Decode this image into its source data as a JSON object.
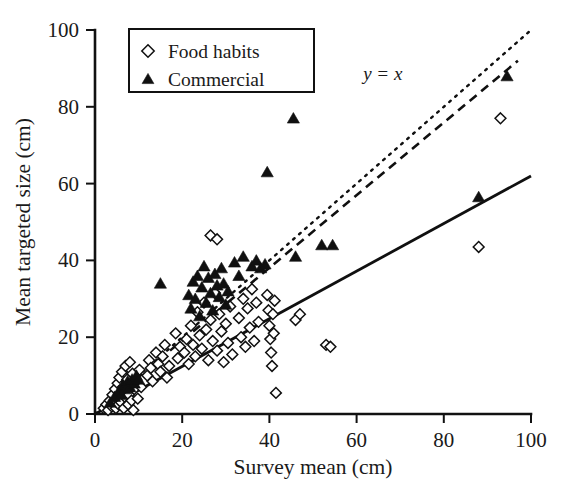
{
  "chart_data": {
    "type": "scatter",
    "title": "",
    "xlabel": "Survey mean (cm)",
    "ylabel": "Mean targeted size (cm)",
    "xlim": [
      0,
      100
    ],
    "ylim": [
      0,
      100
    ],
    "xticks": [
      0,
      20,
      40,
      60,
      80,
      100
    ],
    "yticks": [
      0,
      20,
      40,
      60,
      80,
      100
    ],
    "xtick_labels": [
      "0",
      "20",
      "40",
      "60",
      "80",
      "100"
    ],
    "ytick_labels": [
      "0",
      "20",
      "40",
      "60",
      "80",
      "100"
    ],
    "grid": false,
    "legend_position": "top-left",
    "annotations": [
      {
        "text": "y = x",
        "x": 66,
        "y": 87,
        "style": "italic"
      }
    ],
    "reference_lines": [
      {
        "name": "identity-line",
        "label": "y = x",
        "style": "dotted",
        "x0": 0,
        "y0": 0,
        "x1": 100,
        "y1": 100
      },
      {
        "name": "commercial-fit-line",
        "label": "",
        "style": "dashed",
        "x0": 4,
        "y0": 4,
        "x1": 97,
        "y1": 92
      },
      {
        "name": "food-habits-fit-line",
        "label": "",
        "style": "solid",
        "x0": 0,
        "y0": 0,
        "x1": 100,
        "y1": 62
      }
    ],
    "series": [
      {
        "name": "Food habits",
        "marker": "open-diamond",
        "color": "#ffffff",
        "edge_color": "#101010",
        "points": [
          [
            2.0,
            1.5
          ],
          [
            2.6,
            2.5
          ],
          [
            3.0,
            1.0
          ],
          [
            3.4,
            3.5
          ],
          [
            3.8,
            2.0
          ],
          [
            4.0,
            5.0
          ],
          [
            4.2,
            3.0
          ],
          [
            4.6,
            6.5
          ],
          [
            4.8,
            1.5
          ],
          [
            5.0,
            4.0
          ],
          [
            5.2,
            8.0
          ],
          [
            5.4,
            2.5
          ],
          [
            5.6,
            9.5
          ],
          [
            5.8,
            5.5
          ],
          [
            6.0,
            3.0
          ],
          [
            6.2,
            11.0
          ],
          [
            6.4,
            7.0
          ],
          [
            6.6,
            1.5
          ],
          [
            6.8,
            4.5
          ],
          [
            7.0,
            12.5
          ],
          [
            7.2,
            6.0
          ],
          [
            7.4,
            9.0
          ],
          [
            7.6,
            2.5
          ],
          [
            7.8,
            5.0
          ],
          [
            8.0,
            13.5
          ],
          [
            8.2,
            7.5
          ],
          [
            8.4,
            3.5
          ],
          [
            8.6,
            10.5
          ],
          [
            8.8,
            1.0
          ],
          [
            9.0,
            6.5
          ],
          [
            9.4,
            8.5
          ],
          [
            9.8,
            4.0
          ],
          [
            10.2,
            11.5
          ],
          [
            10.6,
            7.0
          ],
          [
            12.0,
            10.0
          ],
          [
            12.4,
            14.0
          ],
          [
            12.8,
            12.0
          ],
          [
            13.2,
            8.5
          ],
          [
            14.0,
            16.0
          ],
          [
            14.5,
            13.0
          ],
          [
            15.0,
            11.0
          ],
          [
            15.5,
            15.0
          ],
          [
            16.0,
            18.0
          ],
          [
            16.5,
            9.5
          ],
          [
            17.0,
            12.5
          ],
          [
            18.5,
            21.0
          ],
          [
            19.0,
            14.5
          ],
          [
            19.5,
            17.5
          ],
          [
            20.5,
            16.0
          ],
          [
            21.0,
            19.5
          ],
          [
            21.5,
            13.0
          ],
          [
            22.0,
            23.0
          ],
          [
            22.5,
            18.0
          ],
          [
            23.0,
            15.0
          ],
          [
            23.5,
            26.5
          ],
          [
            24.0,
            20.5
          ],
          [
            24.5,
            17.0
          ],
          [
            25.0,
            29.0
          ],
          [
            25.5,
            22.0
          ],
          [
            26.0,
            14.0
          ],
          [
            26.5,
            24.5
          ],
          [
            27.0,
            19.0
          ],
          [
            27.5,
            31.5
          ],
          [
            28.0,
            16.5
          ],
          [
            28.5,
            26.0
          ],
          [
            29.0,
            21.5
          ],
          [
            29.5,
            13.5
          ],
          [
            30.0,
            23.5
          ],
          [
            30.5,
            18.5
          ],
          [
            31.0,
            28.0
          ],
          [
            31.5,
            15.5
          ],
          [
            26.5,
            46.5
          ],
          [
            28.0,
            45.5
          ],
          [
            33.0,
            25.0
          ],
          [
            33.5,
            20.0
          ],
          [
            34.0,
            30.0
          ],
          [
            34.5,
            17.5
          ],
          [
            35.0,
            27.5
          ],
          [
            35.5,
            22.5
          ],
          [
            36.0,
            32.5
          ],
          [
            36.5,
            19.0
          ],
          [
            37.0,
            29.0
          ],
          [
            37.5,
            24.0
          ],
          [
            39.5,
            31.0
          ],
          [
            39.8,
            27.0
          ],
          [
            40.0,
            23.0
          ],
          [
            40.2,
            19.5
          ],
          [
            40.4,
            16.0
          ],
          [
            40.6,
            12.5
          ],
          [
            40.8,
            26.0
          ],
          [
            41.0,
            21.0
          ],
          [
            41.2,
            29.5
          ],
          [
            41.5,
            5.5
          ],
          [
            46.0,
            24.5
          ],
          [
            47.0,
            26.0
          ],
          [
            53.0,
            18.0
          ],
          [
            54.0,
            17.5
          ],
          [
            88.0,
            43.5
          ],
          [
            93.0,
            77.0
          ]
        ]
      },
      {
        "name": "Commercial",
        "marker": "filled-triangle",
        "color": "#101010",
        "edge_color": "#101010",
        "points": [
          [
            3.5,
            3.0
          ],
          [
            4.5,
            4.5
          ],
          [
            5.5,
            6.0
          ],
          [
            6.0,
            5.0
          ],
          [
            6.5,
            7.5
          ],
          [
            7.0,
            6.5
          ],
          [
            7.5,
            8.5
          ],
          [
            8.0,
            7.0
          ],
          [
            8.5,
            9.0
          ],
          [
            9.0,
            8.0
          ],
          [
            9.5,
            10.0
          ],
          [
            10.0,
            9.0
          ],
          [
            15.0,
            34.0
          ],
          [
            21.5,
            31.0
          ],
          [
            22.0,
            27.5
          ],
          [
            22.5,
            34.5
          ],
          [
            23.0,
            30.0
          ],
          [
            23.5,
            36.0
          ],
          [
            24.0,
            25.5
          ],
          [
            24.5,
            33.0
          ],
          [
            25.0,
            38.5
          ],
          [
            25.5,
            29.0
          ],
          [
            26.0,
            35.5
          ],
          [
            26.5,
            31.5
          ],
          [
            27.0,
            27.0
          ],
          [
            27.5,
            36.5
          ],
          [
            28.0,
            33.5
          ],
          [
            28.5,
            30.5
          ],
          [
            29.0,
            38.0
          ],
          [
            29.5,
            34.0
          ],
          [
            30.0,
            28.5
          ],
          [
            30.5,
            32.0
          ],
          [
            32.0,
            39.5
          ],
          [
            33.0,
            36.0
          ],
          [
            34.0,
            41.0
          ],
          [
            36.0,
            38.5
          ],
          [
            37.0,
            40.0
          ],
          [
            38.0,
            38.0
          ],
          [
            39.0,
            39.0
          ],
          [
            39.5,
            63.0
          ],
          [
            45.5,
            77.0
          ],
          [
            46.0,
            41.0
          ],
          [
            52.0,
            44.0
          ],
          [
            54.5,
            44.0
          ],
          [
            88.0,
            56.5
          ],
          [
            94.5,
            88.0
          ]
        ]
      }
    ]
  },
  "legend": {
    "entries": [
      {
        "label": "Food habits",
        "marker": "open-diamond"
      },
      {
        "label": "Commercial",
        "marker": "filled-triangle"
      }
    ]
  },
  "axes": {
    "x_title": "Survey mean (cm)",
    "y_title": "Mean targeted size (cm)"
  }
}
